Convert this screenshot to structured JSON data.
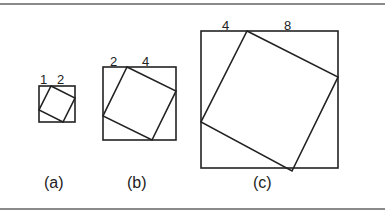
{
  "figure": {
    "panels": [
      {
        "id": "a",
        "caption": "(a)",
        "side_labels": [
          "1",
          "2"
        ],
        "ratio": [
          1,
          2
        ],
        "outer": {
          "x": 39,
          "y": 86,
          "size": 36
        },
        "inner": [
          [
            51,
            86
          ],
          [
            75,
            98
          ],
          [
            63,
            122
          ],
          [
            39,
            110
          ]
        ],
        "label_pos": [
          {
            "x": 40,
            "y": 73
          },
          {
            "x": 57,
            "y": 73
          }
        ],
        "caption_pos": {
          "x": 44,
          "y": 175
        }
      },
      {
        "id": "b",
        "caption": "(b)",
        "side_labels": [
          "2",
          "4"
        ],
        "ratio": [
          2,
          4
        ],
        "outer": {
          "x": 103,
          "y": 67,
          "size": 73
        },
        "inner": [
          [
            127,
            67
          ],
          [
            176,
            91
          ],
          [
            152,
            140
          ],
          [
            103,
            116
          ]
        ],
        "label_pos": [
          {
            "x": 110,
            "y": 55
          },
          {
            "x": 142,
            "y": 55
          }
        ],
        "caption_pos": {
          "x": 127,
          "y": 175
        }
      },
      {
        "id": "c",
        "caption": "(c)",
        "side_labels": [
          "4",
          "8"
        ],
        "ratio": [
          4,
          8
        ],
        "outer": {
          "x": 201,
          "y": 31,
          "size": 137
        },
        "inner": [
          [
            247,
            31
          ],
          [
            338,
            77
          ],
          [
            292,
            171
          ],
          [
            201,
            122
          ]
        ],
        "label_pos": [
          {
            "x": 222,
            "y": 19
          },
          {
            "x": 284,
            "y": 19
          }
        ],
        "caption_pos": {
          "x": 253,
          "y": 175
        }
      }
    ],
    "stroke_color": "#222222",
    "rule_color": "#8a8a8a"
  }
}
